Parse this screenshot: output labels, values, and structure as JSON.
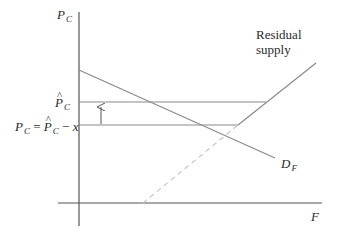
{
  "diagram": {
    "title": "",
    "colors": {
      "axis": "#555555",
      "line": "#8a8a8a",
      "dashed": "#bdbdbd",
      "text": "#2b2b2b"
    },
    "axes": {
      "y_label_main": "P",
      "y_label_sub": "C",
      "x_label": "F",
      "origin": [
        79,
        203
      ],
      "y_top": 12,
      "y_bottom": 226,
      "x_left": 58,
      "x_right": 322
    },
    "labels": {
      "p_hat_main": "P",
      "p_hat_sub": "C",
      "p_hat_accent": "^",
      "pc_eq_left_main": "P",
      "pc_eq_left_sub": "C",
      "pc_eq_equals": " = ",
      "pc_eq_right_main": "P",
      "pc_eq_right_sub": "C",
      "pc_eq_minus": " − ",
      "pc_eq_x": "x",
      "residual_supply_line1": "Residual",
      "residual_supply_line2": "supply",
      "demand_main": "D",
      "demand_sub": "F"
    },
    "curves": {
      "demand_DF": {
        "x1": 79,
        "y1": 70,
        "x2": 275,
        "y2": 158
      },
      "residual_supply_dashed": {
        "x1": 143,
        "y1": 203,
        "x2": 238,
        "y2": 125
      },
      "residual_supply_solid": {
        "x1": 238,
        "y1": 125,
        "x2": 316,
        "y2": 63
      },
      "p_hat_level": {
        "y": 102,
        "x1": 79,
        "x2": 266
      },
      "pc_level": {
        "y": 125,
        "x1": 79,
        "x2": 238
      },
      "arrow": {
        "x": 101,
        "y_from": 124,
        "y_to": 106
      }
    }
  }
}
